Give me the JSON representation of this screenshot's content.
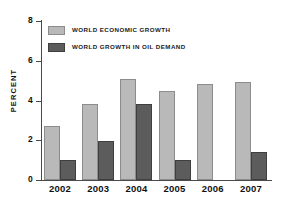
{
  "chart_data": {
    "type": "bar",
    "title": "",
    "subtitle": "",
    "xlabel": "",
    "ylabel": "PERCENT",
    "categories": [
      "2002",
      "2003",
      "2004",
      "2005",
      "2006",
      "2007"
    ],
    "series": [
      {
        "name": "WORLD ECONOMIC GROWTH",
        "color": "#b9b9b9",
        "values": [
          2.7,
          3.8,
          5.1,
          4.5,
          4.85,
          4.95
        ]
      },
      {
        "name": "WORLD GROWTH IN OIL DEMAND",
        "color": "#5c5c5c",
        "values": [
          1.0,
          1.95,
          3.8,
          1.0,
          null,
          1.4
        ]
      }
    ],
    "ylim": [
      0,
      8
    ],
    "yticks": [
      0,
      2,
      4,
      6,
      8
    ],
    "ytick_labels": [
      "0",
      "2",
      "4",
      "6",
      "8"
    ],
    "grid": false,
    "legend_position": "inside-top-left",
    "annotations": []
  },
  "axis": {
    "y_title": "PERCENT",
    "y_tick_labels": [
      "8",
      "6",
      "4",
      "2",
      "0"
    ],
    "x_tick_labels": [
      "2002",
      "2003",
      "2004",
      "2005",
      "2006",
      "2007"
    ]
  },
  "legend": {
    "items": [
      {
        "label": "WORLD ECONOMIC GROWTH",
        "color": "#b9b9b9"
      },
      {
        "label": "WORLD GROWTH IN OIL DEMAND",
        "color": "#5c5c5c"
      }
    ]
  },
  "colors": {
    "series_light": "#b9b9b9",
    "series_dark": "#5c5c5c",
    "axis": "#4a4a4a",
    "text": "#111111",
    "background": "#ffffff"
  }
}
